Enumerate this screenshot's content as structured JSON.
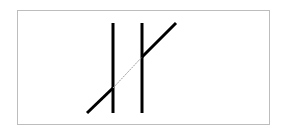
{
  "figure": {
    "type": "poggendorff-illusion",
    "background": "#ffffff",
    "frame_color": "#bdbdbd",
    "line_color": "#000000",
    "hidden_segment_color": "#9e9e9e",
    "verticals": [
      {
        "x": 113,
        "y1": 23,
        "y2": 113
      },
      {
        "x": 142,
        "y1": 23,
        "y2": 113
      }
    ],
    "diagonal": {
      "visible_lower": {
        "x1": 87,
        "y1": 113,
        "x2": 113,
        "y2": 88
      },
      "hidden_middle": {
        "x1": 113,
        "y1": 88,
        "x2": 142,
        "y2": 57
      },
      "visible_upper": {
        "x1": 142,
        "y1": 57,
        "x2": 176,
        "y2": 23
      }
    }
  }
}
